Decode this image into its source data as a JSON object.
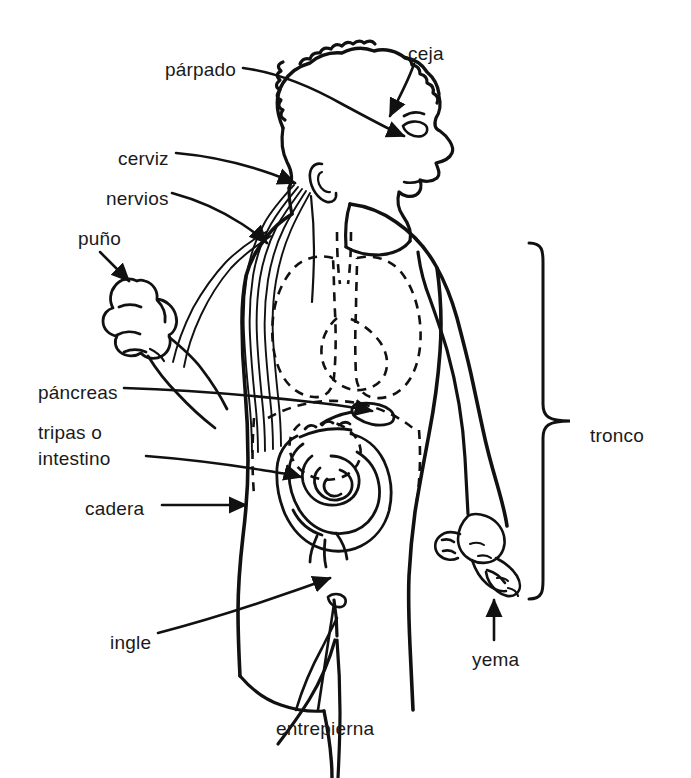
{
  "diagram": {
    "language": "es",
    "type": "labeled-anatomical-illustration",
    "line_color": "#111111",
    "background_color": "#ffffff",
    "labels": [
      {
        "id": "parpado",
        "text": "párpado",
        "x": 165,
        "y": 58,
        "align": "left",
        "lines": 1
      },
      {
        "id": "ceja",
        "text": "ceja",
        "x": 408,
        "y": 42,
        "align": "left",
        "lines": 1
      },
      {
        "id": "cerviz",
        "text": "cerviz",
        "x": 118,
        "y": 147,
        "align": "left",
        "lines": 1
      },
      {
        "id": "nervios",
        "text": "nervios",
        "x": 106,
        "y": 187,
        "align": "left",
        "lines": 1
      },
      {
        "id": "puno",
        "text": "puño",
        "x": 78,
        "y": 227,
        "align": "left",
        "lines": 1
      },
      {
        "id": "pancreas",
        "text": "páncreas",
        "x": 38,
        "y": 381,
        "align": "left",
        "lines": 1
      },
      {
        "id": "intestino",
        "text": "tripas o\nintestino",
        "x": 38,
        "y": 420,
        "align": "left",
        "lines": 2
      },
      {
        "id": "cadera",
        "text": "cadera",
        "x": 85,
        "y": 497,
        "align": "left",
        "lines": 1
      },
      {
        "id": "ingle",
        "text": "ingle",
        "x": 110,
        "y": 631,
        "align": "left",
        "lines": 1
      },
      {
        "id": "entrepierna",
        "text": "entrepierna",
        "x": 276,
        "y": 717,
        "align": "left",
        "lines": 1
      },
      {
        "id": "yema",
        "text": "yema",
        "x": 472,
        "y": 648,
        "align": "left",
        "lines": 1
      },
      {
        "id": "tronco",
        "text": "tronco",
        "x": 590,
        "y": 424,
        "align": "left",
        "lines": 1
      }
    ],
    "brace": {
      "id": "tronco-brace",
      "orientation": "right-facing-curly-brace",
      "top_y": 242,
      "bottom_y": 600,
      "x": 543,
      "tip_x": 570,
      "label_id": "tronco"
    },
    "parts_listed": [
      "párpado",
      "ceja",
      "cerviz",
      "nervios",
      "puño",
      "páncreas",
      "tripas o intestino",
      "cadera",
      "ingle",
      "entrepierna",
      "yema",
      "tronco"
    ]
  }
}
